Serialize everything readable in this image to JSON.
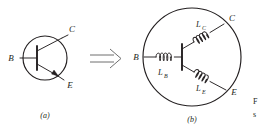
{
  "figure": {
    "kind": "schematic-diagram",
    "background_color": "#ffffff",
    "ink_color": "#231f20",
    "arrow_color": "#6f6f6f"
  },
  "panel_a": {
    "label": "(a)",
    "terminals": [
      {
        "name": "base",
        "label": "B"
      },
      {
        "name": "collector",
        "label": "C"
      },
      {
        "name": "emitter",
        "label": "E"
      }
    ]
  },
  "transform_arrow": {
    "glyph_name": "double-line-right-arrow",
    "symbol": "⟹"
  },
  "panel_b": {
    "label": "(b)",
    "terminals": [
      {
        "name": "base",
        "label": "B"
      },
      {
        "name": "collector",
        "label": "C"
      },
      {
        "name": "emitter",
        "label": "E"
      }
    ],
    "inductors": [
      {
        "name": "base-inductor",
        "symbol": "L",
        "subscript": "B"
      },
      {
        "name": "collector-inductor",
        "symbol": "L",
        "subscript": "C"
      },
      {
        "name": "emitter-inductor",
        "symbol": "L",
        "subscript": "E"
      }
    ]
  },
  "caption_fragment": {
    "line1": "F",
    "line2": "s"
  }
}
